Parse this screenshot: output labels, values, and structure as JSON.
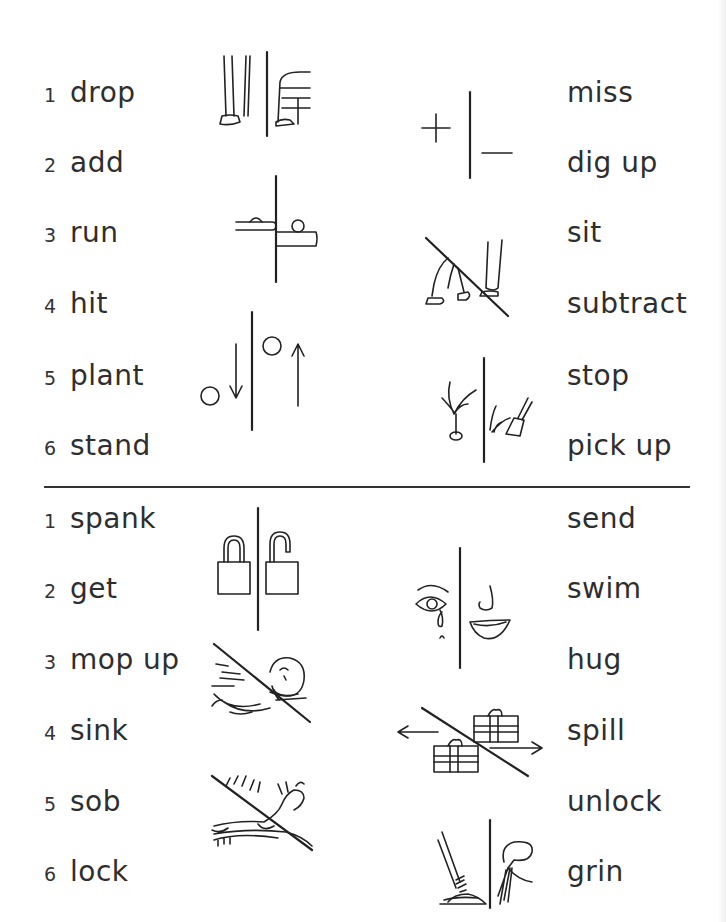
{
  "sections": [
    {
      "left_items": [
        {
          "num": "1",
          "word": "drop"
        },
        {
          "num": "2",
          "word": "add"
        },
        {
          "num": "3",
          "word": "run"
        },
        {
          "num": "4",
          "word": "hit"
        },
        {
          "num": "5",
          "word": "plant"
        },
        {
          "num": "6",
          "word": "stand"
        }
      ],
      "right_words": [
        "miss",
        "dig up",
        "sit",
        "subtract",
        "stop",
        "pick up"
      ],
      "pictograms": [
        "stand-sit-icon",
        "add-subtract-icon",
        "hit-miss-icon",
        "sit-stand-icon",
        "up-down-icon",
        "plant-dig-up-icon"
      ]
    },
    {
      "left_items": [
        {
          "num": "1",
          "word": "spank"
        },
        {
          "num": "2",
          "word": "get"
        },
        {
          "num": "3",
          "word": "mop up"
        },
        {
          "num": "4",
          "word": "sink"
        },
        {
          "num": "5",
          "word": "sob"
        },
        {
          "num": "6",
          "word": "lock"
        }
      ],
      "right_words": [
        "send",
        "swim",
        "hug",
        "spill",
        "unlock",
        "grin"
      ],
      "pictograms": [
        "lock-unlock-icon",
        "sob-grin-icon",
        "swim-sink-icon",
        "send-get-icon",
        "hug-spank-icon",
        "mop-spill-icon"
      ]
    }
  ]
}
